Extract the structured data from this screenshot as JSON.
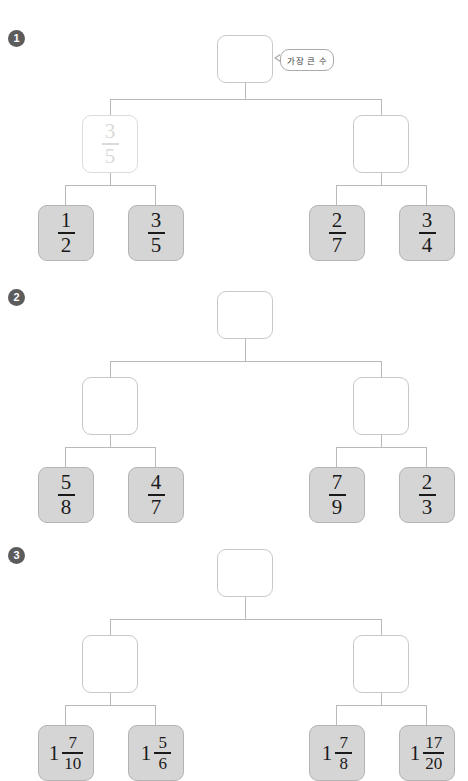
{
  "page": {
    "width": 468,
    "height": 779,
    "background": "#ffffff",
    "leaf_fill": "#d5d5d5",
    "line_color": "#b9b9b9",
    "badge_color": "#5c5c5c",
    "faded_text_color": "#dadada"
  },
  "callout": {
    "text": "가장 큰 수"
  },
  "problems": [
    {
      "number": "1",
      "root": {
        "value": "",
        "state": "empty"
      },
      "mid_left": {
        "value": "3/5",
        "numerator": "3",
        "denominator": "5",
        "state": "faded"
      },
      "mid_right": {
        "value": "",
        "state": "empty"
      },
      "leaves": [
        {
          "numerator": "1",
          "denominator": "2",
          "whole": ""
        },
        {
          "numerator": "3",
          "denominator": "5",
          "whole": ""
        },
        {
          "numerator": "2",
          "denominator": "7",
          "whole": ""
        },
        {
          "numerator": "3",
          "denominator": "4",
          "whole": ""
        }
      ]
    },
    {
      "number": "2",
      "root": {
        "value": "",
        "state": "empty"
      },
      "mid_left": {
        "value": "",
        "state": "empty"
      },
      "mid_right": {
        "value": "",
        "state": "empty"
      },
      "leaves": [
        {
          "numerator": "5",
          "denominator": "8",
          "whole": ""
        },
        {
          "numerator": "4",
          "denominator": "7",
          "whole": ""
        },
        {
          "numerator": "7",
          "denominator": "9",
          "whole": ""
        },
        {
          "numerator": "2",
          "denominator": "3",
          "whole": ""
        }
      ]
    },
    {
      "number": "3",
      "root": {
        "value": "",
        "state": "empty"
      },
      "mid_left": {
        "value": "",
        "state": "empty"
      },
      "mid_right": {
        "value": "",
        "state": "empty"
      },
      "leaves": [
        {
          "numerator": "7",
          "denominator": "10",
          "whole": "1"
        },
        {
          "numerator": "5",
          "denominator": "6",
          "whole": "1"
        },
        {
          "numerator": "7",
          "denominator": "8",
          "whole": "1"
        },
        {
          "numerator": "17",
          "denominator": "20",
          "whole": "1"
        }
      ]
    }
  ]
}
